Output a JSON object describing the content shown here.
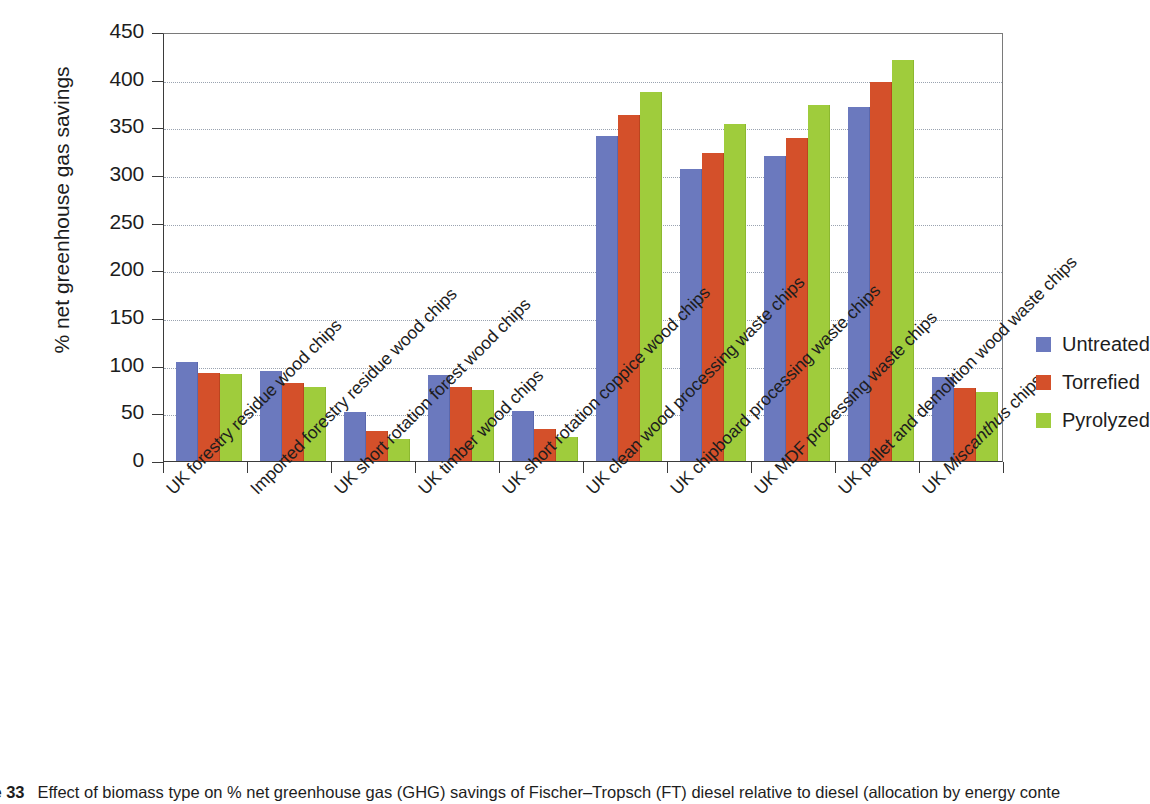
{
  "figure": {
    "caption_label": "re 33",
    "caption_text": "Effect of biomass type on % net greenhouse gas (GHG) savings of Fischer–Tropsch (FT) diesel relative to diesel (allocation by energy conte"
  },
  "legend": {
    "position": "right",
    "items": [
      {
        "label": "Untreated",
        "color": "#6b79be"
      },
      {
        "label": "Torrefied",
        "color": "#d4502a"
      },
      {
        "label": "Pyrolyzed",
        "color": "#9fcc3c"
      }
    ]
  },
  "axis": {
    "y_title": "% net greenhouse gas savings",
    "y_ticks": [
      "0",
      "50",
      "100",
      "150",
      "200",
      "250",
      "300",
      "350",
      "400",
      "450"
    ]
  },
  "chart_data": {
    "type": "bar",
    "title": "",
    "xlabel": "",
    "ylabel": "% net greenhouse gas savings",
    "ylim": [
      0,
      450
    ],
    "ytick_step": 50,
    "grid": true,
    "legend_position": "right",
    "categories": [
      "UK forestry residue wood chips",
      "Imported forestry residue wood chips",
      "UK short rotation forest wood chips",
      "UK timber wood chips",
      "UK short rotation coppice wood chips",
      "UK clean wood processing waste chips",
      "UK chipboard processing waste chips",
      "UK MDF processing waste chips",
      "UK pallet and demolition wood waste chips",
      "UK Miscanthus chips"
    ],
    "categories_italic_word": "Miscanthus",
    "series": [
      {
        "name": "Untreated",
        "color": "#6b79be",
        "values": [
          104,
          94,
          51,
          90,
          52,
          341,
          306,
          320,
          371,
          88
        ]
      },
      {
        "name": "Torrefied",
        "color": "#d4502a",
        "values": [
          92,
          82,
          32,
          78,
          34,
          363,
          323,
          339,
          398,
          77
        ]
      },
      {
        "name": "Pyrolyzed",
        "color": "#9fcc3c",
        "values": [
          91,
          78,
          23,
          75,
          25,
          387,
          353,
          373,
          421,
          72
        ]
      }
    ]
  }
}
